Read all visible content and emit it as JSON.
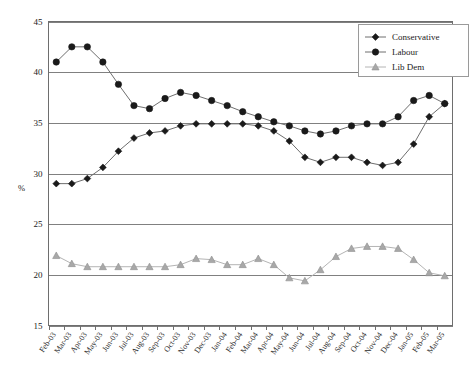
{
  "chart_data": {
    "type": "line",
    "title": "",
    "subtitle": "",
    "xlabel": "",
    "ylabel": "%",
    "ylim": [
      15,
      45
    ],
    "yticks": [
      15,
      20,
      25,
      30,
      35,
      40,
      45
    ],
    "grid": true,
    "legend_position": "top-right",
    "categories": [
      "Feb-03",
      "Mar-03",
      "Apr-03",
      "May-03",
      "Jun-03",
      "Jul-03",
      "Aug-03",
      "Sep-03",
      "Oct-03",
      "Nov-03",
      "Dec-03",
      "Jan-04",
      "Feb-04",
      "Mar-04",
      "Apr-04",
      "May-04",
      "Jun-04",
      "Jul-04",
      "Aug-04",
      "Sep-04",
      "Oct-04",
      "Nov-04",
      "Dec-04",
      "Jan-05",
      "Feb-05",
      "Mar-05"
    ],
    "series": [
      {
        "name": "Conservative",
        "marker": "diamond",
        "color": "#1a1a1a",
        "line_color": "#6e6e6e",
        "values": [
          29.0,
          29.0,
          29.5,
          30.6,
          32.2,
          33.5,
          34.0,
          34.2,
          34.7,
          34.9,
          34.9,
          34.9,
          34.9,
          34.7,
          34.2,
          33.2,
          31.6,
          31.1,
          31.6,
          31.6,
          31.1,
          30.8,
          31.1,
          32.9,
          35.6,
          36.9
        ]
      },
      {
        "name": "Labour",
        "marker": "circle",
        "color": "#1a1a1a",
        "line_color": "#6e6e6e",
        "values": [
          41.0,
          42.5,
          42.5,
          41.0,
          38.8,
          36.7,
          36.4,
          37.4,
          38.0,
          37.7,
          37.2,
          36.7,
          36.1,
          35.6,
          35.1,
          34.7,
          34.2,
          33.9,
          34.2,
          34.7,
          34.9,
          34.9,
          35.6,
          37.2,
          37.7,
          36.9
        ]
      },
      {
        "name": "Lib Dem",
        "marker": "triangle",
        "color": "#a8a8a8",
        "line_color": "#b4b4b4",
        "values": [
          21.9,
          21.1,
          20.8,
          20.8,
          20.8,
          20.8,
          20.8,
          20.8,
          21.0,
          21.6,
          21.5,
          21.0,
          21.0,
          21.6,
          21.0,
          19.7,
          19.4,
          20.5,
          21.8,
          22.6,
          22.8,
          22.8,
          22.6,
          21.5,
          20.2,
          19.9
        ]
      }
    ]
  },
  "legend": {
    "entries": [
      {
        "label": "Conservative"
      },
      {
        "label": "Labour"
      },
      {
        "label": "Lib Dem"
      }
    ]
  }
}
